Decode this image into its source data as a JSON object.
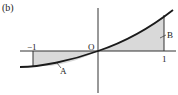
{
  "figure": {
    "panel_label": "(b)",
    "origin_label": "O",
    "tick_neg_one": "−1",
    "tick_pos_one": "1",
    "region_a_label": "A",
    "region_b_label": "B",
    "shade_color": "#d9d9d9",
    "curve_color": "#1a1a1a",
    "axis_color": "#333333"
  }
}
